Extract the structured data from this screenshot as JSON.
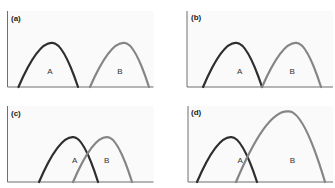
{
  "colors": {
    "curve_A": "#2e2e2e",
    "curve_B": "#858585",
    "axis": "#6f6f6f"
  },
  "chart_data": [
    {
      "type": "area",
      "panel": "(a)",
      "title": "",
      "xlabel": "",
      "ylabel": "",
      "grid": false,
      "note": "Curves given as [start_x, peak_x, end_x, peak_height] in % of axis width/height",
      "series": [
        {
          "name": "A",
          "start": 7.5,
          "peak": 30.5,
          "end": 48.3,
          "height": 58,
          "label_x": 29,
          "label_y": 20
        },
        {
          "name": "B",
          "start": 56.5,
          "peak": 79.8,
          "end": 96.9,
          "height": 58,
          "label_x": 77,
          "label_y": 20
        }
      ]
    },
    {
      "type": "area",
      "panel": "(b)",
      "title": "",
      "xlabel": "",
      "ylabel": "",
      "grid": false,
      "series": [
        {
          "name": "A",
          "start": 11,
          "peak": 33.6,
          "end": 51.4,
          "height": 58,
          "label_x": 36,
          "label_y": 20
        },
        {
          "name": "B",
          "start": 51.4,
          "peak": 74.7,
          "end": 91.8,
          "height": 58,
          "label_x": 72,
          "label_y": 20
        }
      ]
    },
    {
      "type": "area",
      "panel": "(c)",
      "title": "",
      "xlabel": "",
      "ylabel": "",
      "grid": false,
      "series": [
        {
          "name": "A",
          "start": 21.6,
          "peak": 44.9,
          "end": 62,
          "height": 59,
          "label_x": 46,
          "label_y": 28
        },
        {
          "name": "B",
          "start": 44.9,
          "peak": 68.2,
          "end": 85.3,
          "height": 59,
          "label_x": 68,
          "label_y": 28
        }
      ]
    },
    {
      "type": "area",
      "panel": "(d)",
      "title": "",
      "xlabel": "",
      "ylabel": "",
      "grid": false,
      "series": [
        {
          "name": "A",
          "start": 6.2,
          "peak": 29.7,
          "end": 47.6,
          "height": 59,
          "label_x": 36,
          "label_y": 28
        },
        {
          "name": "B",
          "start": 33.1,
          "peak": 69,
          "end": 94.5,
          "height": 93,
          "label_x": 72,
          "label_y": 28
        }
      ]
    }
  ]
}
